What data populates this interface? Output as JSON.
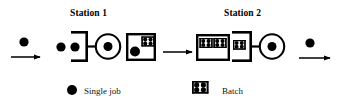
{
  "diagram": {
    "title_station_1": "Station 1",
    "title_station_2": "Station 2",
    "legend": {
      "single_job_label": "Single job",
      "batch_label": "Batch"
    },
    "colors": {
      "stroke": "#000000",
      "fill": "#000000",
      "background": "#ffffff"
    },
    "flow": {
      "inbound_arrow": "single jobs arrive",
      "transfer_arrow": "batch transfer to station 2",
      "outbound_arrow": "single jobs depart"
    },
    "station_1": {
      "input_queue_jobs": 2,
      "input_queue_item_type": "single job",
      "machine": "circle-with-dot",
      "output_queue_items": 1,
      "output_queue_item_type": "batch"
    },
    "station_2": {
      "input_queue_items": 2,
      "input_queue_item_type": "batch",
      "staging_queue_items": 1,
      "staging_queue_item_type": "batch",
      "machine": "circle-with-dot"
    }
  }
}
